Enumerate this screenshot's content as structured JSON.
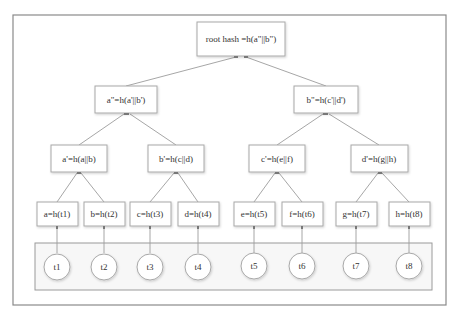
{
  "diagram": {
    "root": {
      "label": "root hash =h(a\"||b\")"
    },
    "level2": [
      {
        "label": "a\"=h(a'||b')"
      },
      {
        "label": "b\"=h(c'||d')"
      }
    ],
    "level3": [
      {
        "label": "a'=h(a||b)"
      },
      {
        "label": "b'=h(c||d)"
      },
      {
        "label": "c'=h(e||f)"
      },
      {
        "label": "d'=h(g||h)"
      }
    ],
    "leaves": [
      {
        "label": "a=h(t1)"
      },
      {
        "label": "b=h(t2)"
      },
      {
        "label": "c=h(t3)"
      },
      {
        "label": "d=h(t4)"
      },
      {
        "label": "e=h(t5)"
      },
      {
        "label": "f=h(t6)"
      },
      {
        "label": "g=h(t7)"
      },
      {
        "label": "h=h(t8)"
      }
    ],
    "transactions": [
      {
        "label": "t1"
      },
      {
        "label": "t2"
      },
      {
        "label": "t3"
      },
      {
        "label": "t4"
      },
      {
        "label": "t5"
      },
      {
        "label": "t6"
      },
      {
        "label": "t7"
      },
      {
        "label": "t8"
      }
    ],
    "colors": {
      "border": "#8a8a8a",
      "node_border": "#a8a8a8",
      "edge": "#9c9c9c",
      "text": "#333333"
    }
  }
}
